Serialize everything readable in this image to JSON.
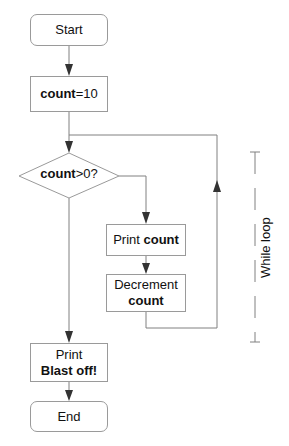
{
  "diagram": {
    "type": "flowchart",
    "nodes": {
      "start": {
        "shape": "rounded-rect",
        "label": "Start"
      },
      "init": {
        "shape": "rect",
        "label_bold": "count",
        "label_rest": "=10"
      },
      "condition": {
        "shape": "diamond",
        "label_bold": "count",
        "label_rest": ">0?"
      },
      "print_count": {
        "shape": "rect",
        "label_plain": "Print ",
        "label_bold": "count"
      },
      "decrement": {
        "shape": "rect",
        "label_line1": "Decrement",
        "label_line2_bold": "count"
      },
      "print_blast": {
        "shape": "rect",
        "label_line1": "Print",
        "label_line2_bold": "Blast off!"
      },
      "end": {
        "shape": "rounded-rect",
        "label": "End"
      }
    },
    "edges": [
      {
        "from": "start",
        "to": "init"
      },
      {
        "from": "init",
        "to": "condition"
      },
      {
        "from": "condition",
        "to": "print_count",
        "branch": "true (right)"
      },
      {
        "from": "print_count",
        "to": "decrement"
      },
      {
        "from": "decrement",
        "to": "condition",
        "note": "loop back"
      },
      {
        "from": "condition",
        "to": "print_blast",
        "branch": "false (down)"
      },
      {
        "from": "print_blast",
        "to": "end"
      }
    ],
    "annotation": {
      "label": "While loop",
      "style": "dashed bracket"
    },
    "colors": {
      "border": "#9a9a9a",
      "line": "#808080",
      "arrow": "#333333",
      "text": "#111111"
    }
  }
}
